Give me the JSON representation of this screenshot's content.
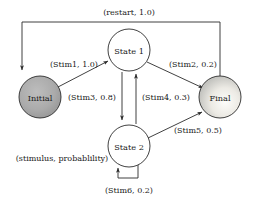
{
  "diagram": {
    "background_color": "#ffffff",
    "stroke_color": "#2b2b2b",
    "text_color": "#1a1a1a",
    "nodes": [
      {
        "id": "initial",
        "label": "Initial",
        "shape": "circle",
        "fill": "#a8a8a8",
        "fill_style": "solid-gray",
        "cx": 40,
        "cy": 97,
        "r": 21
      },
      {
        "id": "state1",
        "label": "State 1",
        "shape": "circle",
        "fill": "#ffffff",
        "fill_style": "white",
        "cx": 129,
        "cy": 50,
        "r": 21
      },
      {
        "id": "state2",
        "label": "State 2",
        "shape": "circle",
        "fill": "#ffffff",
        "fill_style": "white",
        "cx": 129,
        "cy": 146,
        "r": 21
      },
      {
        "id": "final",
        "label": "Final",
        "shape": "circle",
        "fill": "#d9d9d9",
        "fill_style": "radial-gradient-light",
        "cx": 220,
        "cy": 97,
        "r": 21
      }
    ],
    "edges": [
      {
        "id": "restart",
        "label": "(restart, 1.0)",
        "from": "final",
        "to": "initial",
        "route": "top-orthogonal",
        "label_x": 129,
        "label_y": 12
      },
      {
        "id": "stim1",
        "label": "(Stim1, 1.0)",
        "from": "initial",
        "to": "state1",
        "route": "diagonal",
        "label_x": 74,
        "label_y": 64
      },
      {
        "id": "stim2",
        "label": "(Stim2, 0.2)",
        "from": "state1",
        "to": "final",
        "route": "diagonal",
        "label_x": 193,
        "label_y": 64
      },
      {
        "id": "stim3",
        "label": "(Stim3, 0.8)",
        "from": "state1",
        "to": "state2",
        "route": "vertical-down",
        "label_x": 92,
        "label_y": 97
      },
      {
        "id": "stim4",
        "label": "(Stim4, 0.3)",
        "from": "state2",
        "to": "state1",
        "route": "vertical-up",
        "label_x": 166,
        "label_y": 97
      },
      {
        "id": "stim5",
        "label": "(Stim5, 0.5)",
        "from": "state2",
        "to": "final",
        "route": "diagonal",
        "label_x": 198,
        "label_y": 130
      },
      {
        "id": "stim6",
        "label": "(Stim6, 0.2)",
        "from": "state2",
        "to": "state2",
        "route": "self-loop-bottom",
        "label_x": 129,
        "label_y": 190
      }
    ],
    "annotations": [
      {
        "id": "legend",
        "label": "(stimulus, probablility)",
        "x": 62,
        "y": 158
      }
    ]
  }
}
